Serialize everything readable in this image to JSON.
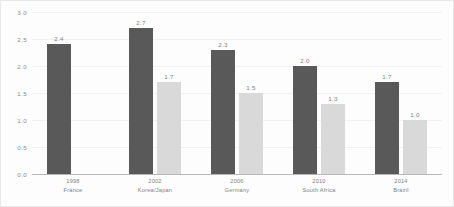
{
  "chart_data": {
    "type": "bar",
    "title": "",
    "subtitle": "",
    "xlabel": "",
    "ylabel": "",
    "ylim": [
      0.0,
      3.0
    ],
    "ytick_values": [
      3.0,
      2.5,
      2.0,
      1.5,
      1.0,
      0.5,
      0.0
    ],
    "ytick_labels": [
      "3.0",
      "2.5",
      "2.0",
      "1.5",
      "1.0",
      "0.5",
      "0.0"
    ],
    "grid": true,
    "grid_axis": "y",
    "legend": false,
    "legend_position": "none",
    "categories": [
      "1998",
      "2002",
      "2006",
      "2010",
      "2014"
    ],
    "category_sublabels": [
      "France",
      "Korea/Japan",
      "Germany",
      "South Africa",
      "Brazil"
    ],
    "series": [
      {
        "name": "series-a",
        "color": "#595959",
        "values": [
          2.4,
          2.7,
          2.3,
          2.0,
          1.7
        ],
        "labels": [
          "2.4",
          "2.7",
          "2.3",
          "2.0",
          "1.7"
        ]
      },
      {
        "name": "series-b",
        "color": "#d9d9d9",
        "values": [
          null,
          1.7,
          1.5,
          1.3,
          1.0
        ],
        "labels": [
          "",
          "1.7",
          "1.5",
          "1.3",
          "1.0"
        ]
      }
    ]
  },
  "colors": {
    "series_a": "#595959",
    "series_b": "#d9d9d9",
    "gridline": "#f1f1f1",
    "axis_line": "#b7b7b7",
    "tick_text": "#8a8a8a",
    "value_text": "#7d7d7d",
    "background": "#fdfdfd"
  }
}
